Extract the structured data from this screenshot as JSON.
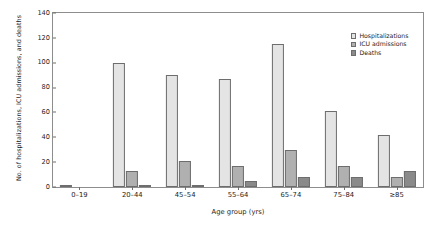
{
  "chart_data": {
    "type": "bar",
    "title": "",
    "xlabel": "Age group (yrs)",
    "ylabel": "No. of hospitalizations, ICU admissions, and deaths",
    "categories": [
      "0–19",
      "20–44",
      "45–54",
      "55–64",
      "65–74",
      "75–84",
      "≥85"
    ],
    "series": [
      {
        "name": "Hospitalizations",
        "color": "#e4e4e4",
        "values": [
          2,
          100,
          90,
          87,
          115,
          61,
          42
        ]
      },
      {
        "name": "ICU admissions",
        "color": "#b0b0b0",
        "values": [
          0,
          13,
          21,
          17,
          30,
          17,
          8
        ]
      },
      {
        "name": "Deaths",
        "color": "#8a8a8a",
        "values": [
          0,
          1,
          2,
          5,
          8,
          8,
          13
        ]
      }
    ],
    "ylim": [
      0,
      140
    ],
    "yticks": [
      0,
      20,
      40,
      60,
      80,
      100,
      120,
      140
    ],
    "grid": false,
    "legend_position": "top-right"
  }
}
